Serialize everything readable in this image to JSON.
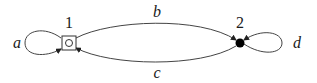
{
  "diagram": {
    "type": "state-transition-graph",
    "nodes": [
      {
        "id": "1",
        "label": "1",
        "shape": "square-with-circle",
        "color": "#ffffff"
      },
      {
        "id": "2",
        "label": "2",
        "shape": "filled-circle",
        "color": "#000000"
      }
    ],
    "edges": [
      {
        "from": "1",
        "to": "1",
        "label": "a",
        "kind": "self-loop-left"
      },
      {
        "from": "1",
        "to": "2",
        "label": "b",
        "kind": "upper-arc"
      },
      {
        "from": "2",
        "to": "1",
        "label": "c",
        "kind": "lower-arc"
      },
      {
        "from": "2",
        "to": "2",
        "label": "d",
        "kind": "self-loop-right"
      }
    ]
  }
}
